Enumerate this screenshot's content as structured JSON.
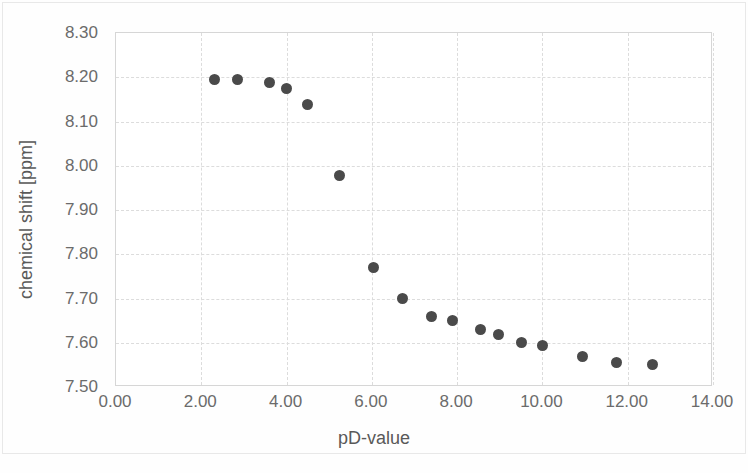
{
  "chart_data": {
    "type": "scatter",
    "title": "",
    "xlabel": "pD-value",
    "ylabel": "chemical shift [ppm]",
    "xlim": [
      0.0,
      14.0
    ],
    "ylim": [
      7.5,
      8.3
    ],
    "xticks": [
      "0.00",
      "2.00",
      "4.00",
      "6.00",
      "8.00",
      "10.00",
      "12.00",
      "14.00"
    ],
    "xtick_values": [
      0,
      2,
      4,
      6,
      8,
      10,
      12,
      14
    ],
    "yticks": [
      "7.50",
      "7.60",
      "7.70",
      "7.80",
      "7.90",
      "8.00",
      "8.10",
      "8.20",
      "8.30"
    ],
    "ytick_values": [
      7.5,
      7.6,
      7.7,
      7.8,
      7.9,
      8.0,
      8.1,
      8.2,
      8.3
    ],
    "grid": true,
    "legend": false,
    "marker_color": "#4a4a4a",
    "series": [
      {
        "name": "chemical shift vs pD",
        "points": [
          {
            "x": 2.32,
            "y": 8.196
          },
          {
            "x": 2.86,
            "y": 8.196
          },
          {
            "x": 3.59,
            "y": 8.189
          },
          {
            "x": 4.01,
            "y": 8.174
          },
          {
            "x": 4.5,
            "y": 8.138
          },
          {
            "x": 5.23,
            "y": 7.979
          },
          {
            "x": 6.05,
            "y": 7.771
          },
          {
            "x": 6.71,
            "y": 7.7
          },
          {
            "x": 7.41,
            "y": 7.659
          },
          {
            "x": 7.9,
            "y": 7.65
          },
          {
            "x": 8.54,
            "y": 7.63
          },
          {
            "x": 8.96,
            "y": 7.619
          },
          {
            "x": 9.52,
            "y": 7.601
          },
          {
            "x": 9.99,
            "y": 7.594
          },
          {
            "x": 10.93,
            "y": 7.57
          },
          {
            "x": 11.73,
            "y": 7.556
          },
          {
            "x": 12.57,
            "y": 7.551
          }
        ]
      }
    ]
  }
}
